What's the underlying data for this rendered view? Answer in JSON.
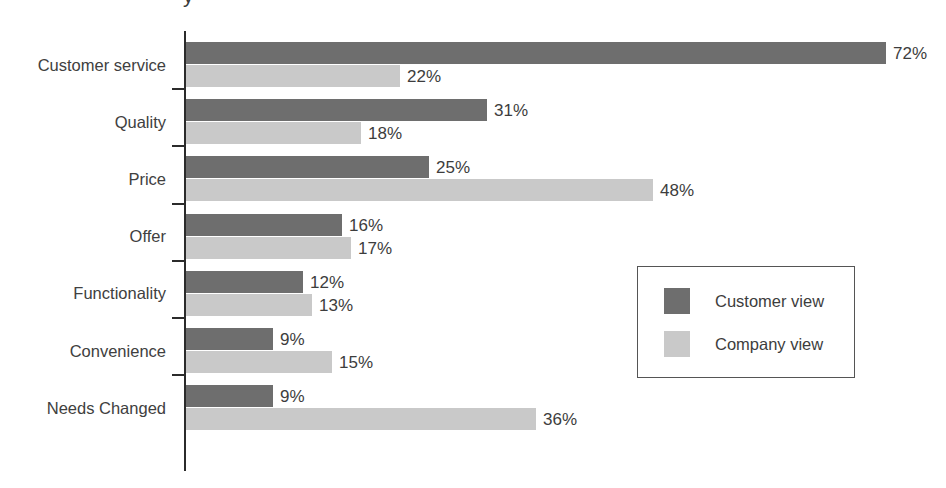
{
  "chart_data": {
    "type": "bar",
    "orientation": "horizontal",
    "title": "",
    "title_fragment": "y",
    "xlabel": "",
    "ylabel": "",
    "xlim": [
      0,
      78
    ],
    "grid": false,
    "legend_position": "middle-right",
    "categories": [
      "Customer service",
      "Quality",
      "Price",
      "Offer",
      "Functionality",
      "Convenience",
      "Needs Changed"
    ],
    "series": [
      {
        "name": "Customer view",
        "color": "#6e6e6e",
        "values": [
          72,
          31,
          25,
          16,
          12,
          9,
          9
        ],
        "labels": [
          "72%",
          "31%",
          "25%",
          "16%",
          "12%",
          "9%",
          "9%"
        ]
      },
      {
        "name": "Company view",
        "color": "#c9c9c9",
        "values": [
          22,
          18,
          48,
          17,
          13,
          15,
          36
        ],
        "labels": [
          "22%",
          "18%",
          "48%",
          "17%",
          "13%",
          "15%",
          "36%"
        ]
      }
    ]
  },
  "legend": {
    "items": [
      {
        "label": "Customer view",
        "color": "#6e6e6e"
      },
      {
        "label": "Company view",
        "color": "#c9c9c9"
      }
    ]
  },
  "colors": {
    "customer_view": "#6e6e6e",
    "company_view": "#c9c9c9",
    "axis": "#2b2b2b",
    "text": "#3d3d3d",
    "background": "#ffffff"
  }
}
